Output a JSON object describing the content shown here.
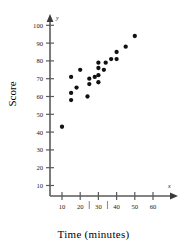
{
  "chart_data": {
    "type": "scatter",
    "title": "",
    "xlabel": "Time  (minutes)",
    "ylabel": "Score",
    "x_var_label": "x",
    "y_var_label": "y",
    "xlim": [
      0,
      68
    ],
    "ylim": [
      0,
      106
    ],
    "grid": false,
    "legend": false,
    "xticks": [
      10,
      20,
      30,
      40,
      50,
      60
    ],
    "yticks": [
      10,
      20,
      30,
      40,
      50,
      60,
      70,
      80,
      90,
      100
    ],
    "xtick_labels": [
      "10",
      "20",
      "30",
      "40",
      "50",
      "60"
    ],
    "ytick_labels": [
      "10",
      "20",
      "30",
      "40",
      "50",
      "60",
      "70",
      "80",
      "90",
      "100"
    ],
    "x_minor_marks": [
      25,
      35
    ],
    "point_count": 21,
    "points": [
      {
        "x": 10,
        "y": 43
      },
      {
        "x": 15,
        "y": 58
      },
      {
        "x": 15,
        "y": 62
      },
      {
        "x": 15,
        "y": 71
      },
      {
        "x": 18,
        "y": 65
      },
      {
        "x": 20,
        "y": 75
      },
      {
        "x": 24,
        "y": 60
      },
      {
        "x": 25,
        "y": 67
      },
      {
        "x": 25,
        "y": 70
      },
      {
        "x": 28,
        "y": 71
      },
      {
        "x": 30,
        "y": 68
      },
      {
        "x": 30,
        "y": 72
      },
      {
        "x": 30,
        "y": 76
      },
      {
        "x": 30,
        "y": 79
      },
      {
        "x": 33,
        "y": 75
      },
      {
        "x": 34,
        "y": 79
      },
      {
        "x": 37,
        "y": 81
      },
      {
        "x": 40,
        "y": 81
      },
      {
        "x": 40,
        "y": 85
      },
      {
        "x": 45,
        "y": 88
      },
      {
        "x": 50,
        "y": 94
      }
    ],
    "colors": {
      "point": "#111111",
      "axis": "#5a5a5a",
      "text": "#1a1a1a",
      "background": "#ffffff"
    }
  }
}
